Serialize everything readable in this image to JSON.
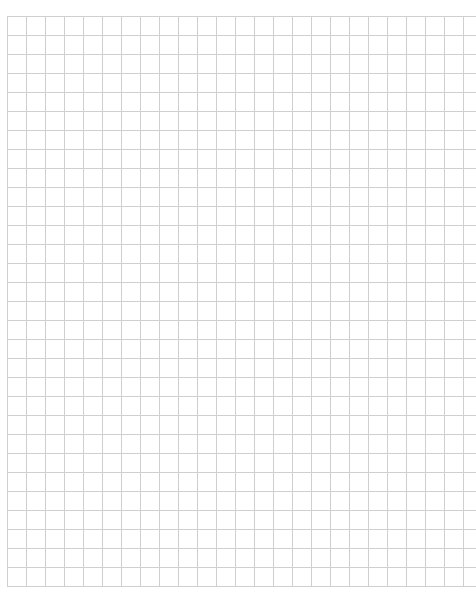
{
  "page": {
    "type": "graph-paper",
    "background_color": "#ffffff",
    "grid_line_color": "#cfcfcf",
    "cell_size_px": 19,
    "columns_visible": 25,
    "rows_visible": 30
  },
  "header": {
    "text": ""
  }
}
